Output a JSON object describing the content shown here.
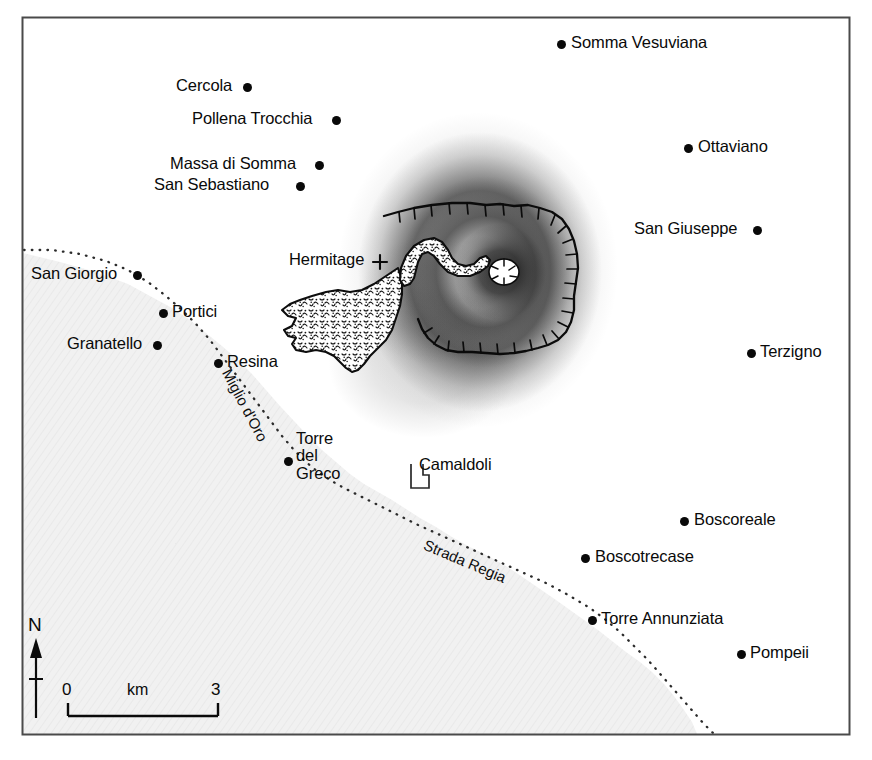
{
  "map": {
    "title": "Map of Mount Vesuvius region",
    "frame": {
      "x": 22,
      "y": 17,
      "width": 828,
      "height": 718,
      "stroke": "#4a4a4a"
    },
    "colors": {
      "sea": "#f0f0f0",
      "land": "#ffffff",
      "ink": "#0a0a0a",
      "frame": "#4a4a4a",
      "relief_dark": "#1d1d1d",
      "lava_fill": "#ffffff"
    },
    "settlements": [
      {
        "name": "Somma Vesuviana",
        "dot_x": 561,
        "dot_y": 44,
        "label_x": 571,
        "label_y": 34,
        "anchor": "left"
      },
      {
        "name": "Cercola",
        "dot_x": 247,
        "dot_y": 87,
        "label_x": 176,
        "label_y": 77,
        "anchor": "right"
      },
      {
        "name": "Pollena Trocchia",
        "dot_x": 336,
        "dot_y": 120,
        "label_x": 192,
        "label_y": 110,
        "anchor": "right"
      },
      {
        "name": "Ottaviano",
        "dot_x": 688,
        "dot_y": 148,
        "label_x": 698,
        "label_y": 138,
        "anchor": "left"
      },
      {
        "name": "Massa di Somma",
        "dot_x": 319,
        "dot_y": 165,
        "label_x": 170,
        "label_y": 155,
        "anchor": "right"
      },
      {
        "name": "San Sebastiano",
        "dot_x": 300,
        "dot_y": 186,
        "label_x": 154,
        "label_y": 176,
        "anchor": "right"
      },
      {
        "name": "San Giuseppe",
        "dot_x": 757,
        "dot_y": 230,
        "label_x": 634,
        "label_y": 220,
        "anchor": "right"
      },
      {
        "name": "San Giorgio",
        "dot_x": 137,
        "dot_y": 275,
        "label_x": 31,
        "label_y": 265,
        "anchor": "right"
      },
      {
        "name": "Portici",
        "dot_x": 163,
        "dot_y": 313,
        "label_x": 175,
        "label_y": 303,
        "anchor": "left"
      },
      {
        "name": "Granatello",
        "dot_x": 157,
        "dot_y": 345,
        "label_x": 67,
        "label_y": 335,
        "anchor": "right"
      },
      {
        "name": "Resina",
        "dot_x": 218,
        "dot_y": 363,
        "label_x": 228,
        "label_y": 353,
        "anchor": "left"
      },
      {
        "name": "Terzigno",
        "dot_x": 751,
        "dot_y": 353,
        "label_x": 761,
        "label_y": 343,
        "anchor": "left"
      },
      {
        "name": "Torre del Greco",
        "dot_x": 288,
        "dot_y": 461,
        "label_x": 298,
        "label_y": 432,
        "anchor": "left",
        "multiline": [
          "Torre",
          "del",
          "Greco"
        ]
      },
      {
        "name": "Boscoreale",
        "dot_x": 684,
        "dot_y": 521,
        "label_x": 694,
        "label_y": 511,
        "anchor": "left"
      },
      {
        "name": "Boscotrecase",
        "dot_x": 585,
        "dot_y": 558,
        "label_x": 595,
        "label_y": 548,
        "anchor": "left"
      },
      {
        "name": "Torre Annunziata",
        "dot_x": 592,
        "dot_y": 620,
        "label_x": 602,
        "label_y": 610,
        "anchor": "left"
      },
      {
        "name": "Pompeii",
        "dot_x": 741,
        "dot_y": 654,
        "label_x": 751,
        "label_y": 644,
        "anchor": "left"
      }
    ],
    "sites": [
      {
        "name": "Hermitage",
        "marker": "cross-marker",
        "label_x": 289,
        "label_y": 250,
        "marker_x": 379,
        "marker_y": 262
      },
      {
        "name": "Camaldoli",
        "marker": "observatory-marker",
        "label_x": 419,
        "label_y": 456,
        "marker_x": 412,
        "marker_y": 473
      }
    ],
    "roads": [
      {
        "name": "Miglio d'Oro",
        "style": "dotted",
        "label_x": 238,
        "label_y": 372,
        "rotation": 61
      },
      {
        "name": "Strada Regia",
        "style": "dotted",
        "label_x": 428,
        "label_y": 538,
        "rotation": 22
      }
    ],
    "scale_bar": {
      "min": "0",
      "max": "3",
      "unit": "km",
      "x": 65,
      "y": 700,
      "length_px": 150
    },
    "compass": {
      "label": "N",
      "x": 34,
      "y": 628
    }
  }
}
